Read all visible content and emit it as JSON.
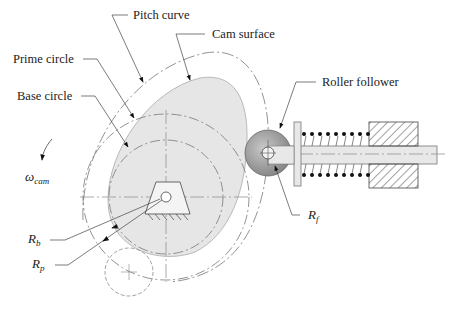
{
  "figure": {
    "labels": {
      "pitch_curve": "Pitch curve",
      "cam_surface": "Cam surface",
      "prime_circle": "Prime circle",
      "base_circle": "Base circle",
      "roller_follower": "Roller follower"
    },
    "symbols": {
      "omega": "ω",
      "omega_sub": "cam",
      "rb": "R",
      "rb_sub": "b",
      "rp": "R",
      "rp_sub": "p",
      "rf": "R",
      "rf_sub": "f"
    },
    "colors": {
      "cam_fill": "#e6e6e6",
      "roller_fill": "#9a9a9a",
      "line": "#555555"
    }
  }
}
